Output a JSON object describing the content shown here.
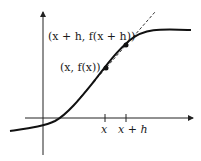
{
  "figure": {
    "type": "secant-line-diagram",
    "labels": {
      "point_x_plus_h": "(x + h, f(x + h))",
      "point_x": "(x, f(x))",
      "tick_x": "x",
      "tick_x_plus_h": "x + h"
    },
    "colors": {
      "curve": "#111111",
      "axes": "#222222",
      "secant": "#333333",
      "background": "#ffffff"
    }
  }
}
